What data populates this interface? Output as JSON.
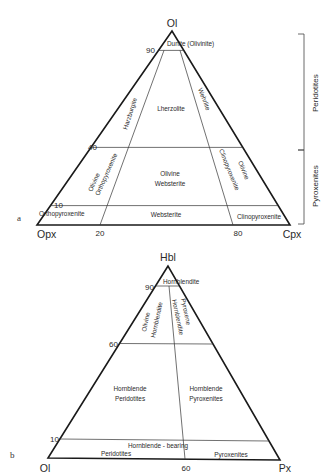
{
  "diagram_a": {
    "panel_label": "a",
    "vertices": {
      "top": "Ol",
      "bottom_left": "Opx",
      "bottom_right": "Cpx"
    },
    "ticks": {
      "left_90": "90",
      "left_40": "40",
      "left_10": "10",
      "bottom_20": "20",
      "bottom_80": "80"
    },
    "fields": {
      "dunite": "Dunite (Olivinite)",
      "harzburgite": "Harzburgite",
      "lherzolite": "Lherzolite",
      "wehrlite": "Wehrlite",
      "ol_orthopyroxenite_1": "Olivine",
      "ol_orthopyroxenite_2": "Orthopyroxenite",
      "ol_websterite_1": "Olivine",
      "ol_websterite_2": "Websterite",
      "ol_clinopyroxenite_1": "Olivine",
      "ol_clinopyroxenite_2": "Clinopyroxenite",
      "orthopyroxenite": "Orthopyroxenite",
      "websterite": "Websterite",
      "clinopyroxenite": "Clinopyroxenite"
    },
    "brackets": {
      "upper": "Peridotites",
      "lower": "Pyroxenites"
    }
  },
  "diagram_b": {
    "panel_label": "b",
    "vertices": {
      "top": "Hbl",
      "bottom_left": "Ol",
      "bottom_right": "Px"
    },
    "ticks": {
      "left_90": "90",
      "left_60": "60",
      "left_10": "10",
      "bottom_60": "60"
    },
    "fields": {
      "hornblendite": "Hornblendite",
      "ol_hornblendite_1": "Olivine",
      "ol_hornblendite_2": "Hornblendite",
      "px_hornblendite_1": "Pyroxene",
      "px_hornblendite_2": "Hornblendite",
      "hbl_peridotites_1": "Hornblende",
      "hbl_peridotites_2": "Peridotites",
      "hbl_pyroxenites_1": "Hornblende",
      "hbl_pyroxenites_2": "Pyroxenites",
      "hbl_bearing": "Hornblende - bearing",
      "bearing_peridotites": "Peridotites",
      "bearing_pyroxenites": "Pyroxenites"
    }
  }
}
